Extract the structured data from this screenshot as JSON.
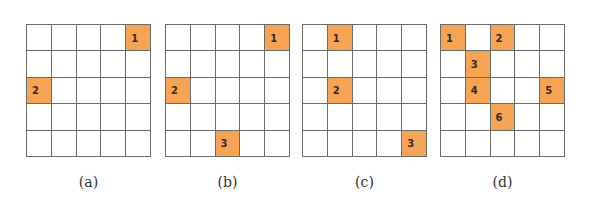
{
  "figure": {
    "grid_size": 5,
    "fill_color": "#f5a455",
    "line_color": "#6a6a6a",
    "panels": [
      {
        "caption": "(a)",
        "left": 26,
        "filled_cells": [
          {
            "row": 0,
            "col": 4,
            "label": "1"
          },
          {
            "row": 2,
            "col": 0,
            "label": "2"
          }
        ]
      },
      {
        "caption": "(b)",
        "left": 165,
        "filled_cells": [
          {
            "row": 0,
            "col": 4,
            "label": "1"
          },
          {
            "row": 2,
            "col": 0,
            "label": "2"
          },
          {
            "row": 4,
            "col": 2,
            "label": "3"
          }
        ]
      },
      {
        "caption": "(c)",
        "left": 302,
        "filled_cells": [
          {
            "row": 0,
            "col": 1,
            "label": "1"
          },
          {
            "row": 2,
            "col": 1,
            "label": "2"
          },
          {
            "row": 4,
            "col": 4,
            "label": "3"
          }
        ]
      },
      {
        "caption": "(d)",
        "left": 440,
        "filled_cells": [
          {
            "row": 0,
            "col": 0,
            "label": "1"
          },
          {
            "row": 0,
            "col": 2,
            "label": "2"
          },
          {
            "row": 1,
            "col": 1,
            "label": "3"
          },
          {
            "row": 2,
            "col": 1,
            "label": "4"
          },
          {
            "row": 2,
            "col": 4,
            "label": "5"
          },
          {
            "row": 3,
            "col": 2,
            "label": "6"
          }
        ]
      }
    ]
  }
}
